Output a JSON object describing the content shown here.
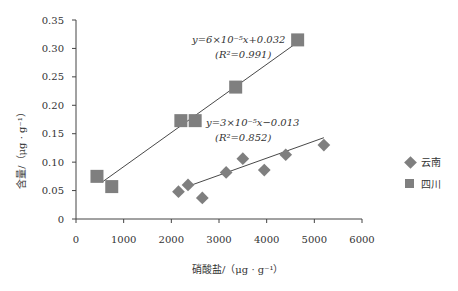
{
  "chart_data": {
    "type": "scatter",
    "title": "",
    "xlabel": "硝酸盐/（μg · g⁻¹）",
    "ylabel": "含量/（μg · g⁻¹）",
    "xlim": [
      0,
      6000
    ],
    "ylim": [
      0,
      0.35
    ],
    "xticks": [
      "0",
      "1000",
      "2000",
      "3000",
      "4000",
      "5000",
      "6000"
    ],
    "yticks": [
      "0",
      "0.05",
      "0.10",
      "0.15",
      "0.20",
      "0.25",
      "0.30",
      "0.35"
    ],
    "grid": false,
    "legend_position": "right",
    "series": [
      {
        "name": "云南",
        "marker": "diamond",
        "color": "#7f7f7f",
        "points": [
          [
            2150,
            0.048
          ],
          [
            2350,
            0.06
          ],
          [
            2650,
            0.037
          ],
          [
            3150,
            0.082
          ],
          [
            3500,
            0.106
          ],
          [
            3950,
            0.086
          ],
          [
            4400,
            0.113
          ],
          [
            5200,
            0.13
          ]
        ],
        "trendline": {
          "equation": "y=3×10⁻⁵x−0.013",
          "r2": "(R²=0.852)",
          "x_range": [
            2350,
            5200
          ]
        }
      },
      {
        "name": "四川",
        "marker": "square",
        "color": "#7f7f7f",
        "points": [
          [
            440,
            0.075
          ],
          [
            750,
            0.057
          ],
          [
            2200,
            0.173
          ],
          [
            2500,
            0.173
          ],
          [
            3350,
            0.232
          ],
          [
            4650,
            0.315
          ]
        ],
        "trendline": {
          "equation": "y=6×10⁻⁵x+0.032",
          "r2": "(R²=0.991)",
          "x_range": [
            550,
            4650
          ]
        }
      }
    ]
  },
  "labels": {
    "xlabel": "硝酸盐/（μg · g⁻¹）",
    "ylabel": "含量/（μg · g⁻¹）",
    "eq_sichuan": "y=6×10⁻⁵x+0.032",
    "r2_sichuan": "(R²=0.991)",
    "eq_yunnan": "y=3×10⁻⁵x−0.013",
    "r2_yunnan": "(R²=0.852)",
    "legend_yunnan": "云南",
    "legend_sichuan": "四川"
  }
}
